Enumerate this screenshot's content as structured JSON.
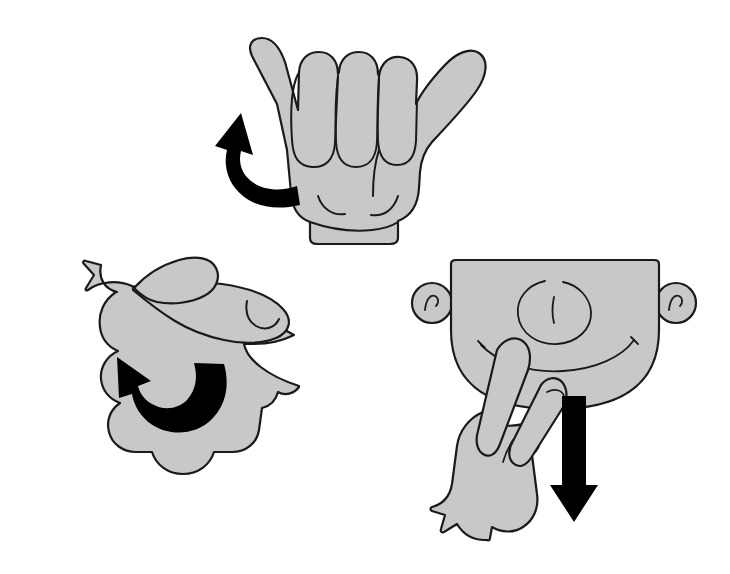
{
  "image": {
    "title": "Three-panel gesture instruction illustration",
    "background_color": "#ffffff",
    "hand_fill_color": "#c8c8c8",
    "outline_color": "#1a1a1a",
    "arrow_color": "#000000",
    "width": 730,
    "height": 574
  },
  "panels": [
    {
      "id": "panel-shaka-hand",
      "name": "shaka-hand-rotating",
      "description": "Hand with thumb and pinky extended, three middle fingers folded, wrist cuff at bottom",
      "motion": "counterclockwise rotation",
      "arrow": {
        "name": "curved-rotation-arrow",
        "type": "curved",
        "direction": "counterclockwise-upward",
        "color": "#000000"
      },
      "parts": [
        "thumb",
        "index-finger-folded",
        "middle-finger-folded",
        "ring-finger-folded",
        "pinky",
        "palm",
        "wrist-cuff"
      ]
    },
    {
      "id": "panel-pointing-hand",
      "name": "pointing-hand-rotating",
      "description": "Side view of a hand pointing to the right with index finger extended and thumb above",
      "motion": "counterclockwise rotation",
      "arrow": {
        "name": "curved-rotation-arrow",
        "type": "curved",
        "direction": "counterclockwise-upward-left",
        "color": "#000000"
      },
      "parts": [
        "index-finger",
        "fingernail",
        "thumb",
        "knuckles",
        "palm"
      ]
    },
    {
      "id": "panel-face-hand",
      "name": "face-with-v-hand-moving-down",
      "description": "Cartoon face with ears, nose and smiling mouth; a hand with two fingers in a V touches the chin area",
      "motion": "downward movement",
      "arrow": {
        "name": "straight-down-arrow",
        "type": "straight",
        "direction": "down",
        "color": "#000000"
      },
      "face_parts": [
        "head",
        "left-ear",
        "right-ear",
        "nose",
        "mouth"
      ],
      "hand_parts": [
        "index-finger",
        "middle-finger",
        "fingernail",
        "thumb",
        "palm",
        "wrist"
      ]
    }
  ]
}
